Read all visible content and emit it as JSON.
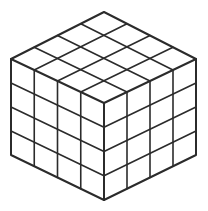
{
  "figure": {
    "background_color": "#ffffff",
    "line_color": "#2b2b2b",
    "fill_color": "#ffffff",
    "outline_width": 2.0,
    "grid_width": 1.6,
    "divisions": 4,
    "visible_faces": 3
  },
  "geometry": {
    "vertices": {
      "top": {
        "x": 104,
        "y": 12,
        "name": "top-apex"
      },
      "left": {
        "x": 11,
        "y": 59,
        "name": "left-upper"
      },
      "right": {
        "x": 196,
        "y": 59,
        "name": "right-upper"
      },
      "center": {
        "x": 104,
        "y": 103,
        "name": "front-center"
      },
      "bottom_left": {
        "x": 11,
        "y": 155,
        "name": "left-lower"
      },
      "bottom_right": {
        "x": 196,
        "y": 155,
        "name": "right-lower"
      },
      "bottom": {
        "x": 104,
        "y": 200,
        "name": "bottom-apex"
      }
    },
    "faces": [
      {
        "name": "top-face",
        "label": "Top",
        "corners": [
          "left",
          "top",
          "right",
          "center"
        ],
        "rows": 4,
        "cols": 4,
        "cells": 16
      },
      {
        "name": "left-face",
        "label": "Left front",
        "corners": [
          "left",
          "center",
          "bottom",
          "bottom_left"
        ],
        "rows": 4,
        "cols": 4,
        "cells": 16
      },
      {
        "name": "right-face",
        "label": "Right front",
        "corners": [
          "center",
          "right",
          "bottom_right",
          "bottom"
        ],
        "rows": 4,
        "cols": 4,
        "cells": 16
      }
    ]
  },
  "chart_data": {
    "type": "diagram",
    "projection": "isometric",
    "total_unit_cubes": 64,
    "visible_unit_faces": 48,
    "edge_divisions": 4
  }
}
